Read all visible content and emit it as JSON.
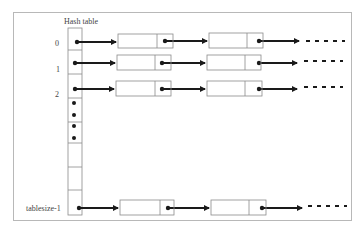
{
  "diagram": {
    "title": "Hash table",
    "row_labels": [
      "0",
      "1",
      "2",
      "tablesize-1"
    ],
    "colors": {
      "arrow": "#1a1a1a",
      "box_border": "#8a8a8a",
      "frame_border": "#b8b8b8",
      "label": "#444444"
    },
    "table_cells": [
      {
        "index": "0",
        "has_pointer": true
      },
      {
        "index": "1",
        "has_pointer": true
      },
      {
        "index": "2",
        "has_pointer": true
      },
      {
        "index": "ellipsis",
        "dots": 2
      },
      {
        "index": "ellipsis",
        "dots": 2
      },
      {
        "index": "empty"
      },
      {
        "index": "empty"
      },
      {
        "index": "tablesize-1",
        "has_pointer": true
      }
    ],
    "chains": [
      {
        "bucket": "0",
        "nodes": 2,
        "continues": true
      },
      {
        "bucket": "1",
        "nodes": 2,
        "continues": true
      },
      {
        "bucket": "2",
        "nodes": 2,
        "continues": true
      },
      {
        "bucket": "tablesize-1",
        "nodes": 2,
        "continues": true
      }
    ]
  }
}
